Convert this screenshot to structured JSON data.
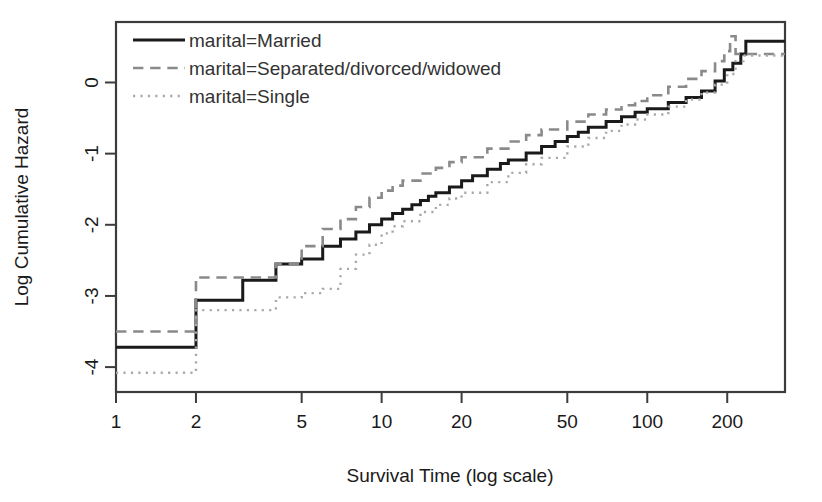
{
  "chart_data": {
    "type": "line",
    "title": "",
    "xlabel": "Survival Time (log scale)",
    "ylabel": "Log Cumulative Hazard",
    "xscale": "log",
    "xlim": [
      1,
      330
    ],
    "ylim": [
      -4.35,
      0.85
    ],
    "xticks": [
      1,
      2,
      5,
      10,
      20,
      50,
      100,
      200
    ],
    "xtick_labels": [
      "1",
      "2",
      "5",
      "10",
      "20",
      "50",
      "100",
      "200"
    ],
    "yticks": [
      0,
      -1,
      -2,
      -3,
      -4
    ],
    "ytick_labels": [
      "0",
      "-1",
      "-2",
      "-3",
      "-4"
    ],
    "grid": false,
    "legend_position": "top-left",
    "series": [
      {
        "name": "marital=Married",
        "legend_label": "marital=Married",
        "style": "solid",
        "color": "#1a1a1a",
        "width": 3.0,
        "points": [
          [
            1,
            -3.72
          ],
          [
            2,
            -3.72
          ],
          [
            2,
            -3.06
          ],
          [
            3,
            -3.06
          ],
          [
            3,
            -2.78
          ],
          [
            4,
            -2.78
          ],
          [
            4,
            -2.55
          ],
          [
            5,
            -2.48
          ],
          [
            6,
            -2.3
          ],
          [
            7,
            -2.2
          ],
          [
            8,
            -2.1
          ],
          [
            9,
            -2.0
          ],
          [
            10,
            -1.92
          ],
          [
            11,
            -1.84
          ],
          [
            12,
            -1.78
          ],
          [
            13,
            -1.72
          ],
          [
            14,
            -1.66
          ],
          [
            15,
            -1.6
          ],
          [
            16,
            -1.55
          ],
          [
            18,
            -1.47
          ],
          [
            20,
            -1.38
          ],
          [
            22,
            -1.31
          ],
          [
            25,
            -1.22
          ],
          [
            28,
            -1.14
          ],
          [
            30,
            -1.09
          ],
          [
            35,
            -0.99
          ],
          [
            40,
            -0.9
          ],
          [
            45,
            -0.83
          ],
          [
            50,
            -0.76
          ],
          [
            55,
            -0.7
          ],
          [
            60,
            -0.63
          ],
          [
            70,
            -0.55
          ],
          [
            80,
            -0.48
          ],
          [
            90,
            -0.42
          ],
          [
            100,
            -0.37
          ],
          [
            120,
            -0.28
          ],
          [
            140,
            -0.21
          ],
          [
            160,
            -0.12
          ],
          [
            180,
            0.02
          ],
          [
            195,
            0.18
          ],
          [
            210,
            0.27
          ],
          [
            225,
            0.4
          ],
          [
            235,
            0.58
          ],
          [
            330,
            0.58
          ]
        ]
      },
      {
        "name": "marital=Separated/divorced/widowed",
        "legend_label": "marital=Separated/divorced/widowed",
        "style": "dashed",
        "color": "#8a8a8a",
        "width": 2.6,
        "points": [
          [
            1,
            -3.5
          ],
          [
            2,
            -3.5
          ],
          [
            2,
            -2.74
          ],
          [
            3,
            -2.74
          ],
          [
            4,
            -2.55
          ],
          [
            5,
            -2.3
          ],
          [
            6,
            -2.06
          ],
          [
            7,
            -1.92
          ],
          [
            8,
            -1.75
          ],
          [
            9,
            -1.62
          ],
          [
            10,
            -1.52
          ],
          [
            11,
            -1.45
          ],
          [
            12,
            -1.38
          ],
          [
            14,
            -1.28
          ],
          [
            16,
            -1.2
          ],
          [
            18,
            -1.12
          ],
          [
            20,
            -1.05
          ],
          [
            25,
            -0.93
          ],
          [
            30,
            -0.83
          ],
          [
            35,
            -0.74
          ],
          [
            40,
            -0.66
          ],
          [
            50,
            -0.55
          ],
          [
            60,
            -0.45
          ],
          [
            70,
            -0.38
          ],
          [
            80,
            -0.32
          ],
          [
            90,
            -0.26
          ],
          [
            100,
            -0.18
          ],
          [
            120,
            -0.06
          ],
          [
            140,
            0.05
          ],
          [
            160,
            0.16
          ],
          [
            180,
            0.3
          ],
          [
            195,
            0.44
          ],
          [
            205,
            0.65
          ],
          [
            215,
            0.4
          ],
          [
            330,
            0.4
          ]
        ]
      },
      {
        "name": "marital=Single",
        "legend_label": "marital=Single",
        "style": "dotted",
        "color": "#a8a8a8",
        "width": 2.4,
        "points": [
          [
            1,
            -4.08
          ],
          [
            2,
            -4.08
          ],
          [
            2,
            -3.2
          ],
          [
            3,
            -3.2
          ],
          [
            4,
            -3.02
          ],
          [
            5,
            -2.96
          ],
          [
            6,
            -2.9
          ],
          [
            7,
            -2.62
          ],
          [
            8,
            -2.42
          ],
          [
            9,
            -2.28
          ],
          [
            10,
            -2.12
          ],
          [
            11,
            -2.02
          ],
          [
            12,
            -1.95
          ],
          [
            14,
            -1.82
          ],
          [
            16,
            -1.72
          ],
          [
            18,
            -1.63
          ],
          [
            20,
            -1.55
          ],
          [
            25,
            -1.4
          ],
          [
            30,
            -1.27
          ],
          [
            35,
            -1.15
          ],
          [
            40,
            -1.06
          ],
          [
            50,
            -0.9
          ],
          [
            60,
            -0.78
          ],
          [
            70,
            -0.68
          ],
          [
            80,
            -0.59
          ],
          [
            90,
            -0.52
          ],
          [
            100,
            -0.45
          ],
          [
            120,
            -0.34
          ],
          [
            140,
            -0.24
          ],
          [
            160,
            -0.14
          ],
          [
            180,
            -0.03
          ],
          [
            200,
            0.12
          ],
          [
            215,
            0.3
          ],
          [
            230,
            0.38
          ],
          [
            330,
            0.38
          ]
        ]
      }
    ]
  },
  "axes": {
    "x_title": "Survival Time (log scale)",
    "y_title": "Log Cumulative Hazard",
    "x_tick_labels": [
      "1",
      "2",
      "5",
      "10",
      "20",
      "50",
      "100",
      "200"
    ],
    "y_tick_labels": [
      "0",
      "-1",
      "-2",
      "-3",
      "-4"
    ]
  },
  "legend": {
    "entries": [
      {
        "label": "marital=Married",
        "style": "solid"
      },
      {
        "label": "marital=Separated/divorced/widowed",
        "style": "dashed"
      },
      {
        "label": "marital=Single",
        "style": "dotted"
      }
    ]
  },
  "colors": {
    "line_married": "#1a1a1a",
    "line_separated": "#8a8a8a",
    "line_single": "#a8a8a8",
    "frame": "#3c3c3c",
    "text": "#1a1a1a",
    "background": "#ffffff"
  }
}
